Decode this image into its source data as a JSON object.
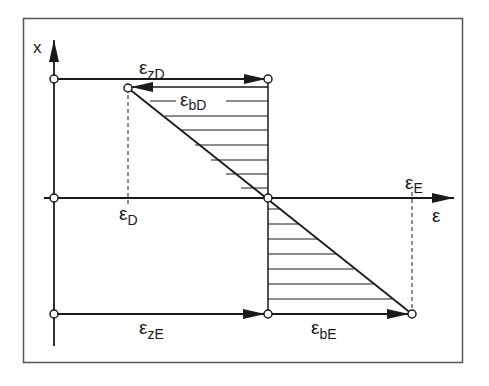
{
  "diagram": {
    "type": "strain-distribution",
    "axes": {
      "vertical_label": "x",
      "horizontal_label": "ε"
    },
    "labels": {
      "eps_zD": {
        "main": "ε",
        "sub": "zD"
      },
      "eps_bD": {
        "main": "ε",
        "sub": "bD"
      },
      "eps_D": {
        "main": "ε",
        "sub": "D"
      },
      "eps_E": {
        "main": "ε",
        "sub": "E"
      },
      "eps_zE": {
        "main": "ε",
        "sub": "zE"
      },
      "eps_bE": {
        "main": "ε",
        "sub": "bE"
      }
    },
    "colors": {
      "line": "#1a1a1a",
      "frame": "#555555",
      "background": "#ffffff"
    }
  }
}
